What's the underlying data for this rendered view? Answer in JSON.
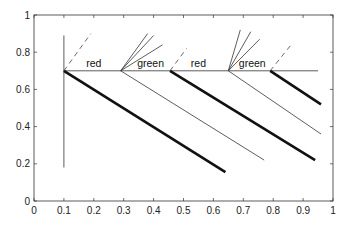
{
  "chart_data": {
    "type": "line",
    "title": "",
    "xlabel": "",
    "ylabel": "",
    "xlim": [
      0,
      1
    ],
    "ylim": [
      0,
      1
    ],
    "grid": false,
    "legend": null,
    "xticks": [
      "0",
      "0.1",
      "0.2",
      "0.3",
      "0.4",
      "0.5",
      "0.6",
      "0.7",
      "0.8",
      "0.9",
      "1"
    ],
    "yticks": [
      "0",
      "0.2",
      "0.4",
      "0.6",
      "0.8",
      "1"
    ],
    "annotations": [
      {
        "text": "red",
        "x": 0.2,
        "y": 0.72
      },
      {
        "text": "green",
        "x": 0.39,
        "y": 0.72
      },
      {
        "text": "red",
        "x": 0.55,
        "y": 0.72
      },
      {
        "text": "green",
        "x": 0.73,
        "y": 0.72
      }
    ],
    "series": [
      {
        "name": "horizontal baseline",
        "style": "thin-solid",
        "points": [
          [
            0.1,
            0.7
          ],
          [
            0.95,
            0.7
          ]
        ]
      },
      {
        "name": "vertical at 0.1",
        "style": "thin-solid",
        "points": [
          [
            0.1,
            0.18
          ],
          [
            0.1,
            0.89
          ]
        ]
      },
      {
        "name": "thick descent 1",
        "style": "thick-solid",
        "points": [
          [
            0.1,
            0.7
          ],
          [
            0.64,
            0.155
          ]
        ]
      },
      {
        "name": "thin descent 1",
        "style": "thin-solid",
        "points": [
          [
            0.29,
            0.7
          ],
          [
            0.77,
            0.22
          ]
        ]
      },
      {
        "name": "thick descent 2",
        "style": "thick-solid",
        "points": [
          [
            0.455,
            0.7
          ],
          [
            0.94,
            0.22
          ]
        ]
      },
      {
        "name": "thin descent 2",
        "style": "thin-solid",
        "points": [
          [
            0.65,
            0.7
          ],
          [
            0.96,
            0.36
          ]
        ]
      },
      {
        "name": "thick descent 3",
        "style": "thick-solid",
        "points": [
          [
            0.79,
            0.7
          ],
          [
            0.96,
            0.52
          ]
        ]
      },
      {
        "name": "dashed 1",
        "style": "dashed",
        "points": [
          [
            0.1,
            0.7
          ],
          [
            0.19,
            0.9
          ]
        ]
      },
      {
        "name": "dashed 2",
        "style": "dashed",
        "points": [
          [
            0.455,
            0.7
          ],
          [
            0.51,
            0.82
          ]
        ]
      },
      {
        "name": "dashed 3",
        "style": "dashed",
        "points": [
          [
            0.79,
            0.7
          ],
          [
            0.86,
            0.84
          ]
        ]
      },
      {
        "name": "fan 1a",
        "style": "thin-solid",
        "points": [
          [
            0.29,
            0.7
          ],
          [
            0.38,
            0.9
          ]
        ]
      },
      {
        "name": "fan 1b",
        "style": "thin-solid",
        "points": [
          [
            0.29,
            0.7
          ],
          [
            0.4,
            0.89
          ]
        ]
      },
      {
        "name": "fan 1c",
        "style": "thin-solid",
        "points": [
          [
            0.29,
            0.7
          ],
          [
            0.43,
            0.84
          ]
        ]
      },
      {
        "name": "fan 2a",
        "style": "thin-solid",
        "points": [
          [
            0.65,
            0.7
          ],
          [
            0.69,
            0.92
          ]
        ]
      },
      {
        "name": "fan 2b",
        "style": "thin-solid",
        "points": [
          [
            0.65,
            0.7
          ],
          [
            0.725,
            0.91
          ]
        ]
      },
      {
        "name": "fan 2c",
        "style": "thin-solid",
        "points": [
          [
            0.65,
            0.7
          ],
          [
            0.755,
            0.87
          ]
        ]
      }
    ]
  }
}
